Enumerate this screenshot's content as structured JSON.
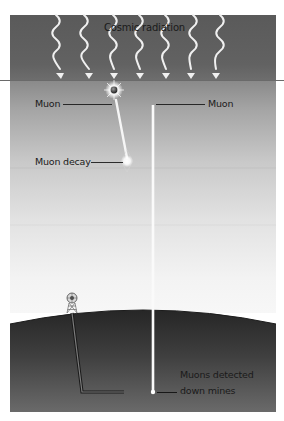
{
  "diagram": {
    "title": "Cosmic radiation",
    "labels": {
      "muon_left": "Muon",
      "muon_right": "Muon",
      "muon_decay": "Muon decay",
      "detected_line1": "Muons detected",
      "detected_line2": "down mines"
    },
    "elements": {
      "cosmic_rays": 7,
      "particles": [
        "muon",
        "muon-decay"
      ],
      "mine": "mine-headframe-and-shaft"
    },
    "colors": {
      "upper_atmosphere": "#5e5e5e",
      "lower_sky_top": "#8c8c8c",
      "lower_sky_bottom": "#f4f4f4",
      "ground_top": "#2e2e2e",
      "ground_bottom": "#6a6a6a",
      "ray": "#f2f2f2",
      "track": "#ffffff"
    }
  }
}
